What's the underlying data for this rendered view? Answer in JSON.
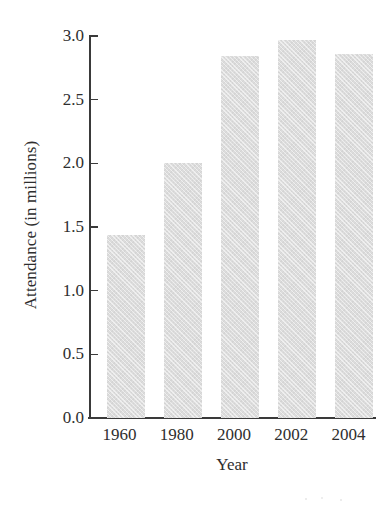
{
  "chart_data": {
    "type": "bar",
    "title": "",
    "subtitle": "",
    "xlabel": "Year",
    "ylabel": "Attendance (in millions)",
    "categories": [
      "1960",
      "1980",
      "2000",
      "2002",
      "2004"
    ],
    "values": [
      1.44,
      2.0,
      2.84,
      2.97,
      2.86
    ],
    "series": [
      {
        "name": "Attendance",
        "values": [
          1.44,
          2.0,
          2.84,
          2.97,
          2.86
        ]
      }
    ],
    "ylim": [
      0.0,
      3.0
    ],
    "ytick_labels": [
      "3.0",
      "2.5",
      "2.0",
      "1.5",
      "1.0",
      "0.5",
      "0.0"
    ],
    "ytick_values": [
      3.0,
      2.5,
      2.0,
      1.5,
      1.0,
      0.5,
      0.0
    ],
    "ytick_step": 0.5,
    "grid": false,
    "legend": false,
    "legend_position": "none",
    "annotations": [],
    "bar_color": "#dcdcdc",
    "axis_color": "#3a3a3a",
    "text_color": "#2e2e2e",
    "background_color": "#ffffff"
  }
}
